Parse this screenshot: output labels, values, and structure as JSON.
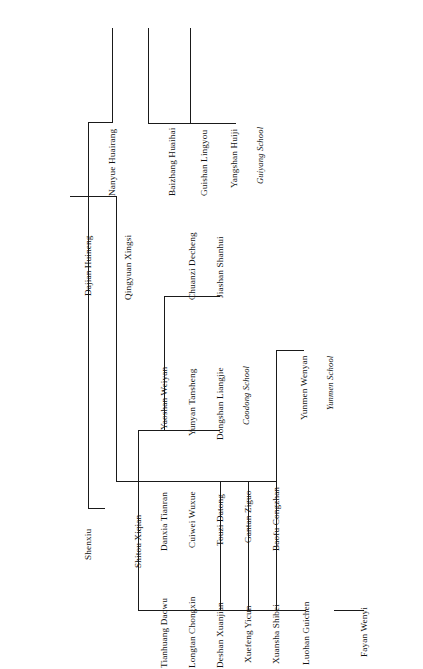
{
  "diagram": {
    "orientation": "rotated-90",
    "line_color": "#1a1a1a",
    "background": "#ffffff",
    "text_color": "#111111"
  },
  "nodes": {
    "dajian_huineng": "Dajian Huineng",
    "shenxiu": "Shenxiu",
    "nanyue_huairang": "Nanyue Huairang",
    "qingyuan_xingsi": "Qingyuan Xingsi",
    "baizhang_huaihai": "Baizhang Huaihai",
    "guishan_lingyou": "Guishan Lingyou",
    "yangshan_huiji": "Yangshan Huiji",
    "guiyang_school": "Guiyang School",
    "shitou_xiqian": "Shitou Xiqian",
    "yaoshan_weiyan": "Yaoshan Weiyan",
    "yunyan_tansheng": "Yunyan Tansheng",
    "dongshan_liangjie": "Dongshan Liangjie",
    "caodong_school": "Caodong School",
    "chuanzi_decheng": "Chuanzi Decheng",
    "jiashan_shanhui": "Jiashan Shanhui",
    "danxia_tianran": "Danxia Tianran",
    "cuiwei_wuxue": "Cuiwei Wuxue",
    "touzi_datong": "Touzi Datong",
    "gantan_ziguo": "Gantan Ziguo",
    "tianhuang_daowu": "Tianhuang Daowu",
    "longtan_chongxin": "Longtan Chongxin",
    "deshan_xuanjian": "Deshan Xuanjian",
    "xuefeng_yicun": "Xuefeng Yicun",
    "baofu_congzhan": "Baofu Congzhan",
    "yunmen_wenyan": "Yunmen Wenyan",
    "yunmen_school": "Yunmen School",
    "xuansha_shibei": "Xuansha Shibei",
    "luohan_guichen": "Luohan Guichen",
    "fayan_wenyi": "Fayan Wenyi"
  },
  "edges": [
    "dajian_huineng -> nanyue_huairang",
    "dajian_huineng -> qingyuan_xingsi",
    "dajian_huineng -> shenxiu",
    "nanyue_huairang -> baizhang_huaihai",
    "baizhang_huaihai -> guishan_lingyou",
    "guishan_lingyou -> yangshan_huiji",
    "yangshan_huiji -> guiyang_school",
    "qingyuan_xingsi -> shitou_xiqian",
    "shitou_xiqian -> yaoshan_weiyan",
    "shitou_xiqian -> danxia_tianran",
    "shitou_xiqian -> tianhuang_daowu",
    "yaoshan_weiyan -> yunyan_tansheng",
    "yaoshan_weiyan -> chuanzi_decheng",
    "yunyan_tansheng -> dongshan_liangjie",
    "dongshan_liangjie -> caodong_school",
    "chuanzi_decheng -> jiashan_shanhui",
    "danxia_tianran -> cuiwei_wuxue",
    "cuiwei_wuxue -> touzi_datong",
    "touzi_datong -> gantan_ziguo",
    "tianhuang_daowu -> longtan_chongxin",
    "longtan_chongxin -> deshan_xuanjian",
    "deshan_xuanjian -> xuefeng_yicun",
    "xuefeng_yicun -> baofu_congzhan",
    "xuefeng_yicun -> xuansha_shibei",
    "baofu_congzhan -> yunmen_wenyan",
    "yunmen_wenyan -> yunmen_school",
    "xuansha_shibei -> luohan_guichen",
    "luohan_guichen -> fayan_wenyi"
  ]
}
